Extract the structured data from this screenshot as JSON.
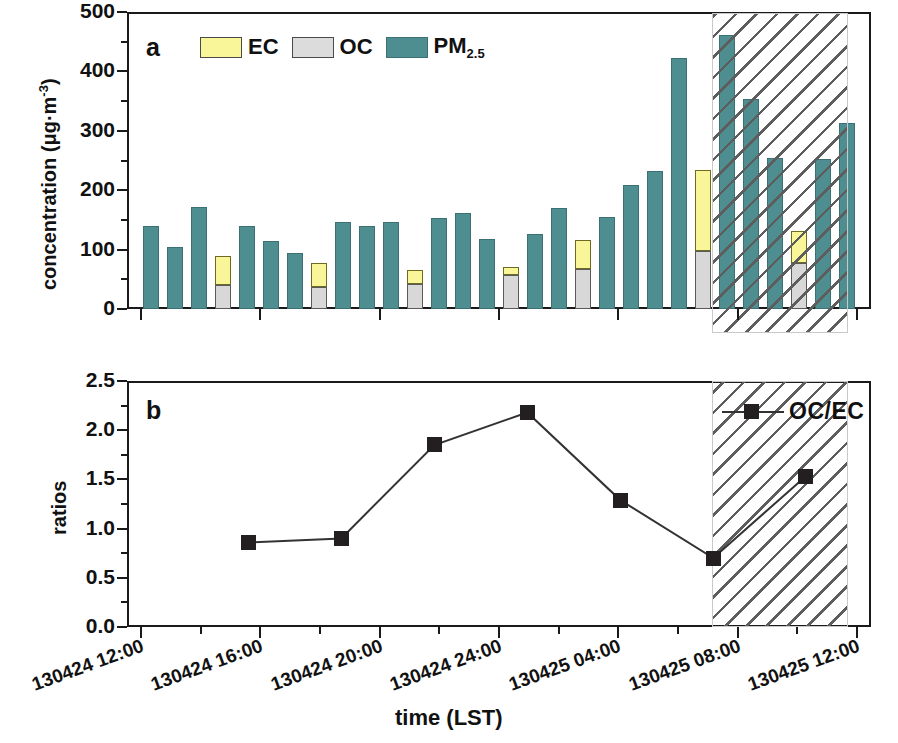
{
  "figure": {
    "xaxis_title": "time (LST)",
    "xtick_labels": [
      "130424 12:00",
      "130424 16:00",
      "130424 20:00",
      "130424 24:00",
      "130425 04:00",
      "130425 08:00",
      "130425 12:00"
    ]
  },
  "panel_a": {
    "letter": "a",
    "ylabel_main": "concentration (",
    "ylabel_unit": "μg·m",
    "ylabel_exp": "-3",
    "ylabel_close": ")",
    "yticks": [
      "0",
      "100",
      "200",
      "300",
      "400",
      "500"
    ],
    "legend": [
      {
        "key": "ec",
        "label": "EC",
        "color": "#f9f69a"
      },
      {
        "key": "oc",
        "label": "OC",
        "color": "#dcdcdc"
      },
      {
        "key": "pm",
        "label": "PM",
        "sub": "2.5",
        "color": "#4e8e91"
      }
    ]
  },
  "panel_b": {
    "letter": "b",
    "ylabel": "ratios",
    "yticks": [
      "0.0",
      "0.5",
      "1.0",
      "1.5",
      "2.0",
      "2.5"
    ],
    "legend_label": "OC/EC",
    "marker_color": "#231f20"
  },
  "colors": {
    "pm25": "#4e8e91",
    "oc": "#d8d8d8",
    "ec": "#f9f69a",
    "axis": "#1a1a1a",
    "hatch": "#5d5d5d",
    "marker": "#231f20"
  },
  "chart_data": [
    {
      "type": "bar",
      "panel": "a",
      "title": "a",
      "xlabel": "time (LST)",
      "ylabel": "concentration (μg·m-3)",
      "ylim": [
        0,
        500
      ],
      "yticks": [
        0,
        100,
        200,
        300,
        400,
        500
      ],
      "grid": false,
      "legend_position": "top-center",
      "x_time_labels": [
        "130424 12:00",
        "130424 16:00",
        "130424 20:00",
        "130424 24:00",
        "130425 04:00",
        "130425 08:00",
        "130425 12:00"
      ],
      "bars": [
        {
          "time": "130424 13:00",
          "pm25": 140,
          "oc": null,
          "ec": null
        },
        {
          "time": "130424 14:00",
          "pm25": 105,
          "oc": null,
          "ec": null
        },
        {
          "time": "130424 15:00",
          "pm25": 172,
          "oc": null,
          "ec": null
        },
        {
          "time": "130424 16:00",
          "pm25": null,
          "oc": 41,
          "ec": 89
        },
        {
          "time": "130424 16:00b",
          "pm25": 140,
          "oc": null,
          "ec": null
        },
        {
          "time": "130424 18:00",
          "pm25": 114,
          "oc": null,
          "ec": null
        },
        {
          "time": "130424 19:00",
          "pm25": 94,
          "oc": null,
          "ec": null
        },
        {
          "time": "130424 20:00",
          "pm25": null,
          "oc": 37,
          "ec": 78
        },
        {
          "time": "130424 20:00b",
          "pm25": 147,
          "oc": null,
          "ec": null
        },
        {
          "time": "130424 22:00",
          "pm25": 139,
          "oc": null,
          "ec": null
        },
        {
          "time": "130424 23:00",
          "pm25": 147,
          "oc": null,
          "ec": null
        },
        {
          "time": "130424 24:00",
          "pm25": null,
          "oc": 42,
          "ec": 65
        },
        {
          "time": "130424 24:00b",
          "pm25": 154,
          "oc": null,
          "ec": null
        },
        {
          "time": "130425 01:00",
          "pm25": 161,
          "oc": null,
          "ec": null
        },
        {
          "time": "130425 02:00",
          "pm25": 118,
          "oc": null,
          "ec": null
        },
        {
          "time": "130425 03:00",
          "pm25": null,
          "oc": 57,
          "ec": 70
        },
        {
          "time": "130425 03:00b",
          "pm25": 126,
          "oc": null,
          "ec": null
        },
        {
          "time": "130425 04:00",
          "pm25": 170,
          "oc": null,
          "ec": null
        },
        {
          "time": "130425 05:00",
          "pm25": null,
          "oc": 67,
          "ec": 117
        },
        {
          "time": "130425 05:00b",
          "pm25": 155,
          "oc": null,
          "ec": null
        },
        {
          "time": "130425 06:00",
          "pm25": 209,
          "oc": null,
          "ec": null
        },
        {
          "time": "130425 07:00",
          "pm25": 233,
          "oc": null,
          "ec": null
        },
        {
          "time": "130425 08:00",
          "pm25": 423,
          "oc": null,
          "ec": null
        },
        {
          "time": "130425 08:30",
          "pm25": null,
          "oc": 98,
          "ec": 234
        },
        {
          "time": "130425 09:00",
          "pm25": 462,
          "oc": null,
          "ec": null
        },
        {
          "time": "130425 09:30",
          "pm25": 353,
          "oc": null,
          "ec": null
        },
        {
          "time": "130425 10:00",
          "pm25": 255,
          "oc": null,
          "ec": null
        },
        {
          "time": "130425 10:30",
          "pm25": null,
          "oc": 78,
          "ec": 131
        },
        {
          "time": "130425 11:00",
          "pm25": 253,
          "oc": null,
          "ec": null
        },
        {
          "time": "130425 12:00",
          "pm25": 313,
          "oc": null,
          "ec": null
        }
      ],
      "shaded_region": {
        "label": "hatched",
        "start_time": "130425 06:30",
        "end_time": "130425 11:20"
      }
    },
    {
      "type": "line",
      "panel": "b",
      "title": "b",
      "xlabel": "time (LST)",
      "ylabel": "ratios",
      "ylim": [
        0.0,
        2.5
      ],
      "yticks": [
        0.0,
        0.5,
        1.0,
        1.5,
        2.0,
        2.5
      ],
      "grid": false,
      "legend_position": "top-right",
      "series": [
        {
          "name": "OC/EC",
          "marker": "square",
          "x_times": [
            "130424 16:00",
            "130424 19:00",
            "130424 22:00",
            "130425 01:00",
            "130425 04:00",
            "130425 07:00",
            "130425 10:30"
          ],
          "values": [
            0.86,
            0.9,
            1.85,
            2.18,
            1.29,
            0.7,
            1.53
          ]
        }
      ],
      "shaded_region": {
        "label": "hatched",
        "start_time": "130425 06:30",
        "end_time": "130425 11:20"
      }
    }
  ]
}
